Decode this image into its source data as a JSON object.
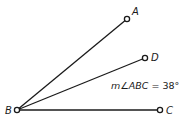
{
  "diagram": {
    "type": "geometry-angle",
    "points": [
      {
        "id": "B",
        "label": "B",
        "x": 17,
        "y": 110,
        "label_x": 5,
        "label_y": 114
      },
      {
        "id": "A",
        "label": "A",
        "x": 127,
        "y": 19,
        "label_x": 132,
        "label_y": 15
      },
      {
        "id": "D",
        "label": "D",
        "x": 145,
        "y": 58,
        "label_x": 151,
        "label_y": 60
      },
      {
        "id": "C",
        "label": "C",
        "x": 160,
        "y": 110,
        "label_x": 166,
        "label_y": 114
      }
    ],
    "rays": [
      {
        "from": "B",
        "to": "A"
      },
      {
        "from": "B",
        "to": "D"
      },
      {
        "from": "B",
        "to": "C"
      }
    ],
    "measure": {
      "prefix": "m",
      "angle_symbol": "∠",
      "angle_name": "ABC",
      "equals": " = ",
      "value": "38°",
      "x": 111,
      "y": 89
    }
  }
}
